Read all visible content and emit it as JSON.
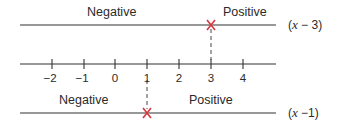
{
  "diagram": {
    "type": "sign-chart",
    "top_line": {
      "left_label": "Negative",
      "right_label": "Positive",
      "expression": "(x − 3)",
      "expression_var": "x",
      "expression_rest": " − 3)",
      "zero_at": 3
    },
    "number_line": {
      "ticks": [
        "−2",
        "−1",
        "0",
        "1",
        "2",
        "3",
        "4"
      ],
      "tick_values": [
        -2,
        -1,
        0,
        1,
        2,
        3,
        4
      ]
    },
    "bottom_line": {
      "left_label": "Negative",
      "right_label": "Positive",
      "expression": "(x −1)",
      "expression_var": "x",
      "expression_rest": " −1)",
      "zero_at": 1
    },
    "colors": {
      "line": "#333333",
      "marker": "#d9363e"
    }
  }
}
